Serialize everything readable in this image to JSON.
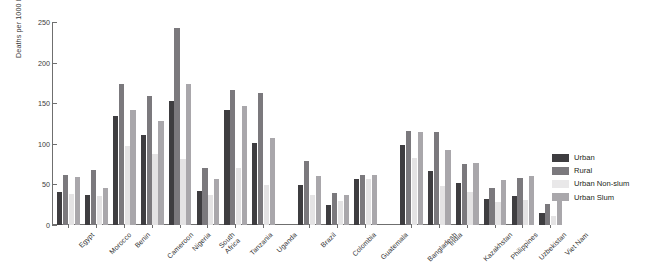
{
  "chart_data": {
    "type": "bar",
    "title": "",
    "xlabel": "",
    "ylabel": "Deaths per 1000 births",
    "ylim": [
      0,
      250
    ],
    "yticks": [
      0,
      50,
      100,
      150,
      200,
      250
    ],
    "grid": false,
    "legend_position": "right",
    "categories": [
      "Egypt",
      "Morocco",
      "Benin",
      "Cameroon",
      "Nigeria",
      "South Africa",
      "Tanzania",
      "Uganda",
      "Brazil",
      "Colombia",
      "Guatemala",
      "Bangladesh",
      "India",
      "Kazakhstan",
      "Philippines",
      "Uzbekistan",
      "Viet Nam"
    ],
    "category_lines": [
      [
        "Egypt"
      ],
      [
        "Morocco"
      ],
      [
        "Benin"
      ],
      [
        "Cameroon"
      ],
      [
        "Nigeria"
      ],
      [
        "South",
        "Africa"
      ],
      [
        "Tanzania"
      ],
      [
        "Uganda"
      ],
      [
        "Brazil"
      ],
      [
        "Colombia"
      ],
      [
        "Guatemala"
      ],
      [
        "Bangladesh"
      ],
      [
        "India"
      ],
      [
        "Kazakhstan"
      ],
      [
        "Philippines"
      ],
      [
        "Uzbekistan"
      ],
      [
        "Viet Nam"
      ]
    ],
    "group_gaps_after": [
      "Uganda",
      "Guatemala"
    ],
    "series": [
      {
        "name": "Urban",
        "color": "#3e3d40",
        "values": [
          41,
          37,
          134,
          111,
          153,
          42,
          142,
          101,
          49,
          25,
          57,
          99,
          66,
          52,
          32,
          36,
          15
        ]
      },
      {
        "name": "Rural",
        "color": "#7b797d",
        "values": [
          61,
          68,
          174,
          159,
          243,
          70,
          166,
          163,
          79,
          40,
          62,
          116,
          115,
          75,
          46,
          58,
          26
        ]
      },
      {
        "name": "Urban Non-slum",
        "color": "#e4e3e4",
        "values": [
          38,
          36,
          97,
          87,
          81,
          37,
          70,
          49,
          37,
          30,
          57,
          83,
          48,
          41,
          28,
          31,
          11
        ]
      },
      {
        "name": "Urban Slum",
        "color": "#a9a7ab",
        "values": [
          59,
          45,
          142,
          128,
          174,
          57,
          147,
          107,
          60,
          37,
          61,
          115,
          92,
          76,
          55,
          60,
          36
        ]
      }
    ]
  },
  "legend": {
    "items": [
      {
        "label": "Urban",
        "swatch": "urban"
      },
      {
        "label": "Rural",
        "swatch": "rural"
      },
      {
        "label": "Urban Non-slum",
        "swatch": "nonslum"
      },
      {
        "label": "Urban Slum",
        "swatch": "slum"
      }
    ]
  }
}
